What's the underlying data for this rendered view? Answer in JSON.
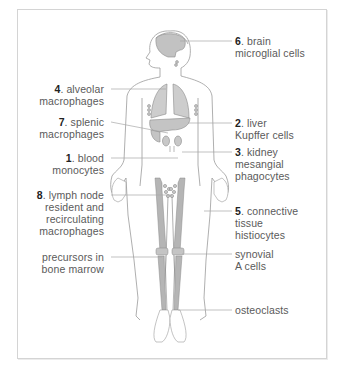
{
  "diagram": {
    "colors": {
      "frame_border": "#d4d4d4",
      "outline": "#9a9a9a",
      "organ_fill": "#c8c8c8",
      "bone_fill": "#b5b5b5",
      "leader_line": "#a8a8a8",
      "text": "#5a5a5a",
      "number": "#222222"
    },
    "labels_left": [
      {
        "id": "alveolar",
        "number": "4",
        "line1": ". alveolar",
        "line2": "macrophages",
        "line3": ""
      },
      {
        "id": "splenic",
        "number": "7",
        "line1": ". splenic",
        "line2": "macrophages",
        "line3": ""
      },
      {
        "id": "blood",
        "number": "1",
        "line1": ". blood",
        "line2": "monocytes",
        "line3": ""
      },
      {
        "id": "lymph",
        "number": "8",
        "line1": ". lymph node",
        "line2": "resident and",
        "line3": "recirculating",
        "line4": "macrophages"
      },
      {
        "id": "precursors",
        "number": "",
        "line1": "precursors in",
        "line2": "bone marrow",
        "line3": ""
      }
    ],
    "labels_right": [
      {
        "id": "brain",
        "number": "6",
        "line1": ". brain",
        "line2": "microglial cells",
        "line3": ""
      },
      {
        "id": "liver",
        "number": "2",
        "line1": ". liver",
        "line2": "Kupffer cells",
        "line3": ""
      },
      {
        "id": "kidney",
        "number": "3",
        "line1": ". kidney",
        "line2": "mesangial",
        "line3": "phagocytes"
      },
      {
        "id": "connective",
        "number": "5",
        "line1": ". connective",
        "line2": "tissue",
        "line3": "histiocytes"
      },
      {
        "id": "synovial",
        "number": "",
        "line1": "synovial",
        "line2": "A cells",
        "line3": ""
      },
      {
        "id": "osteoclasts",
        "number": "",
        "line1": "osteoclasts",
        "line2": "",
        "line3": ""
      }
    ]
  }
}
